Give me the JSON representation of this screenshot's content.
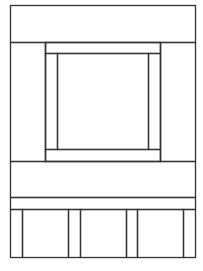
{
  "diagram": {
    "type": "line-drawing-panel-layout",
    "stroke_color": "#333333",
    "background": "#ffffff",
    "outer": {
      "x": 10,
      "y": 5,
      "w": 185,
      "h": 252
    },
    "rects": [
      {
        "name": "top-band",
        "x": 10,
        "y": 5,
        "w": 185,
        "h": 37
      },
      {
        "name": "left-column",
        "x": 10,
        "y": 42,
        "w": 35,
        "h": 119
      },
      {
        "name": "right-column",
        "x": 160,
        "y": 42,
        "w": 35,
        "h": 119
      },
      {
        "name": "inner-frame",
        "x": 45,
        "y": 42,
        "w": 115,
        "h": 119
      },
      {
        "name": "inner-frame-top",
        "x": 45,
        "y": 42,
        "w": 115,
        "h": 11
      },
      {
        "name": "inner-left-strip",
        "x": 45,
        "y": 53,
        "w": 12,
        "h": 96
      },
      {
        "name": "inner-right-strip",
        "x": 148,
        "y": 53,
        "w": 12,
        "h": 96
      },
      {
        "name": "center-square",
        "x": 57,
        "y": 53,
        "w": 91,
        "h": 96
      },
      {
        "name": "inner-frame-bottom",
        "x": 45,
        "y": 149,
        "w": 115,
        "h": 12
      },
      {
        "name": "middle-band",
        "x": 10,
        "y": 161,
        "w": 185,
        "h": 36
      },
      {
        "name": "thin-band",
        "x": 10,
        "y": 197,
        "w": 185,
        "h": 12
      },
      {
        "name": "bottom-strip-1",
        "x": 10,
        "y": 209,
        "w": 12,
        "h": 48
      },
      {
        "name": "bottom-panel-1",
        "x": 22,
        "y": 209,
        "w": 46,
        "h": 48
      },
      {
        "name": "bottom-strip-2",
        "x": 68,
        "y": 209,
        "w": 12,
        "h": 48
      },
      {
        "name": "bottom-panel-2",
        "x": 80,
        "y": 209,
        "w": 46,
        "h": 48
      },
      {
        "name": "bottom-strip-3",
        "x": 126,
        "y": 209,
        "w": 11,
        "h": 48
      },
      {
        "name": "bottom-panel-3",
        "x": 137,
        "y": 209,
        "w": 46,
        "h": 48
      },
      {
        "name": "bottom-strip-4",
        "x": 183,
        "y": 209,
        "w": 12,
        "h": 48
      }
    ]
  }
}
